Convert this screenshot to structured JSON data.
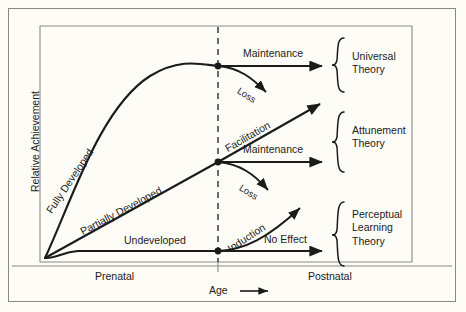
{
  "figure": {
    "type": "diagram",
    "kind": "conceptual-line-diagram",
    "background_color": "#fdfcf7",
    "frame_color": "#8a8a84",
    "ink_color": "#1b1b1b"
  },
  "axes": {
    "y_label": "Relative Achievement",
    "x_label": "Age",
    "x_label_arrow": "⟶",
    "x_ticks": [
      {
        "label": "Prenatal"
      },
      {
        "label": "Postnatal"
      }
    ],
    "divider": {
      "name": "birth-dashed-line",
      "style": "dashed",
      "note": ""
    }
  },
  "curves": [
    {
      "id": "fully-developed",
      "label": "Fully Developed",
      "shape": "steep-rising-then-plateau",
      "end_level": "high"
    },
    {
      "id": "partially-developed",
      "label": "Partially Developed",
      "shape": "linear-rising",
      "end_level": "medium"
    },
    {
      "id": "undeveloped",
      "label": "Undeveloped",
      "shape": "flat-baseline",
      "end_level": "low"
    }
  ],
  "branches": [
    {
      "group": "universal",
      "from": "fully-developed",
      "arrows": [
        {
          "label": "Maintenance",
          "direction": "horizontal-right"
        },
        {
          "label": "Loss",
          "direction": "curving-down"
        }
      ]
    },
    {
      "group": "attunement",
      "from": "partially-developed",
      "arrows": [
        {
          "label": "Facilitation",
          "direction": "diagonal-up-right"
        },
        {
          "label": "Maintenance",
          "direction": "horizontal-right"
        },
        {
          "label": "Loss",
          "direction": "curving-down"
        }
      ]
    },
    {
      "group": "perceptual-learning",
      "from": "undeveloped",
      "arrows": [
        {
          "label": "Induction",
          "direction": "curving-up-right"
        },
        {
          "label": "No Effect",
          "direction": "horizontal-right"
        }
      ]
    }
  ],
  "theories": [
    {
      "id": "universal",
      "lines": [
        "Universal",
        "Theory"
      ]
    },
    {
      "id": "attunement",
      "lines": [
        "Attunement",
        "Theory"
      ]
    },
    {
      "id": "perceptual-learning",
      "lines": [
        "Perceptual",
        "Learning",
        "Theory"
      ]
    }
  ]
}
